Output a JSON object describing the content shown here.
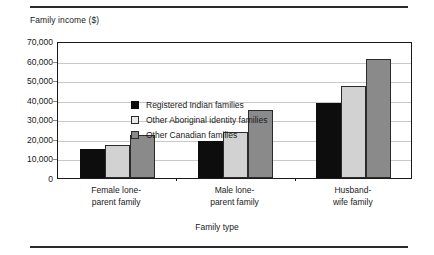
{
  "chart_data": {
    "type": "bar",
    "title": "",
    "xlabel": "Family type",
    "ylabel": "Family income ($)",
    "categories": [
      "Female lone-\nparent family",
      "Male lone-\nparent family",
      "Husband-\nwife family"
    ],
    "series": [
      {
        "name": "Registered Indian families",
        "color": "#0d0d0d",
        "values": [
          15000,
          19000,
          38500
        ]
      },
      {
        "name": "Other Aboriginal identity families",
        "color": "#d2d2d2",
        "values": [
          17000,
          23500,
          47000
        ]
      },
      {
        "name": "Other Canadian families",
        "color": "#8a8a8a",
        "values": [
          22000,
          35000,
          61000
        ]
      }
    ],
    "ylim": [
      0,
      70000
    ],
    "ytick_values": [
      0,
      10000,
      20000,
      30000,
      40000,
      50000,
      60000,
      70000
    ],
    "ytick_labels": [
      "0",
      "10,000",
      "20,000",
      "30,000",
      "40,000",
      "50,000",
      "60,000",
      "70,000"
    ],
    "grid": true,
    "legend_position": "upper-left-inside"
  },
  "figure": {
    "y_axis_title": "Family income ($)",
    "x_axis_title": "Family type"
  }
}
